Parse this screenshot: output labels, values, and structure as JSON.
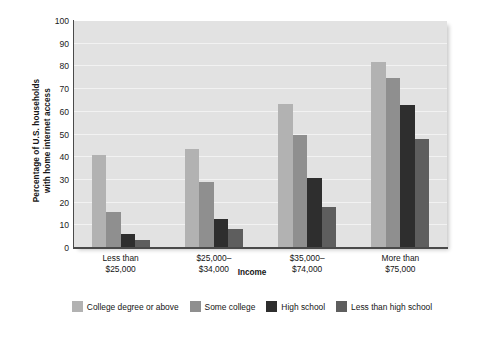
{
  "chart_data": {
    "type": "bar",
    "title": "",
    "xlabel": "Income",
    "ylabel": "Percentage of U.S. households with home internet access",
    "ylabel_line1": "Percentage of U.S. households",
    "ylabel_line2": "with home internet access",
    "categories": [
      "Less than\n$25,000",
      "$25,000–\n$34,000",
      "$35,000–\n$74,000",
      "More than\n$75,000"
    ],
    "series": [
      {
        "name": "College degree or above",
        "color": "#b2b2b2",
        "values": [
          41,
          43.5,
          63.5,
          82
        ]
      },
      {
        "name": "Some college",
        "color": "#8f8f8f",
        "values": [
          16,
          29,
          50,
          75
        ]
      },
      {
        "name": "High school",
        "color": "#2e2e2e",
        "values": [
          6,
          13,
          31,
          63
        ]
      },
      {
        "name": "Less than high school",
        "color": "#5e5e5e",
        "values": [
          3.5,
          8.5,
          18,
          48
        ]
      }
    ],
    "ylim": [
      0,
      100
    ],
    "yticks": [
      0,
      10,
      20,
      30,
      40,
      50,
      60,
      70,
      80,
      90,
      100
    ],
    "grid": true,
    "legend_position": "bottom",
    "plot_background": "#e2e2e2",
    "gridline_color": "#f2f2f2",
    "axis_color": "#4a4a4a"
  }
}
